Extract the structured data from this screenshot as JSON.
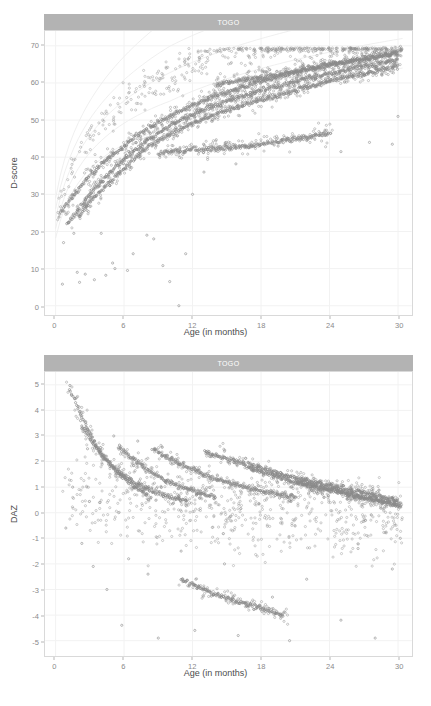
{
  "figure": {
    "width": 431,
    "height": 706,
    "background": "#ffffff",
    "point_color": "#8a8a8a",
    "strip_color": "#b3b3b3",
    "strip_text_color": "#ffffff",
    "grid_color": "#f2f2f2",
    "panel_border_color": "#d9d9d9",
    "axis_text_color": "#8a8a8a",
    "axis_title_color": "#4d4d4d"
  },
  "panels": [
    {
      "id": "dscore",
      "strip_label": "TOGO",
      "x_axis_title": "Age (in months)",
      "y_axis_title": "D-score",
      "x_ticks": [
        "0",
        "6",
        "12",
        "18",
        "24",
        "30"
      ],
      "y_ticks": [
        "0",
        "10",
        "20",
        "30",
        "40",
        "50",
        "60",
        "70"
      ]
    },
    {
      "id": "daz",
      "strip_label": "TOGO",
      "x_axis_title": "Age (in months)",
      "y_axis_title": "DAZ",
      "x_ticks": [
        "0",
        "6",
        "12",
        "18",
        "24",
        "30"
      ],
      "y_ticks": [
        "-5",
        "-4",
        "-3",
        "-2",
        "-1",
        "0",
        "1",
        "2",
        "3",
        "4",
        "5"
      ]
    }
  ],
  "chart_data": [
    {
      "type": "scatter",
      "title": "TOGO",
      "xlabel": "Age (in months)",
      "ylabel": "D-score",
      "xlim": [
        -0.9,
        31.2
      ],
      "ylim": [
        -2.5,
        74
      ],
      "x_ticks": [
        0,
        6,
        12,
        18,
        24,
        30
      ],
      "y_ticks": [
        0,
        10,
        20,
        30,
        40,
        50,
        60,
        70
      ],
      "grid": true,
      "legend": "none",
      "point_color": "#8a8a8a",
      "point_size": 1.1,
      "description": "D-score plotted against age in months for Togo; dense longitudinal cohort threads rise steeply from about 24 D-score at birth, pass ~45-50 around 9 months and saturate near 66-69 by 30 months, with a wide scatter of lower outliers.",
      "cohort_threads": [
        {
          "name": "thread-a",
          "x": [
            0.3,
            1.0,
            2.0,
            3.0,
            4.0,
            5.0,
            6.0,
            7.0,
            8.0,
            9.0,
            10.0,
            12.0,
            14.0,
            16.0,
            18.0,
            21.0,
            24.0,
            27.0,
            30.0
          ],
          "y": [
            24.0,
            27.5,
            31.5,
            35.0,
            38.0,
            40.5,
            43.0,
            45.5,
            47.5,
            49.5,
            51.0,
            54.0,
            56.5,
            58.5,
            60.5,
            63.0,
            65.0,
            66.5,
            68.0
          ]
        },
        {
          "name": "thread-b",
          "x": [
            1.0,
            2.0,
            3.0,
            4.0,
            5.0,
            6.0,
            7.0,
            8.0,
            9.0,
            10.0,
            12.0,
            14.0,
            16.0,
            18.0,
            21.0,
            24.0,
            27.0,
            30.0
          ],
          "y": [
            22.0,
            26.0,
            30.0,
            33.5,
            36.5,
            39.5,
            42.0,
            44.5,
            46.5,
            48.5,
            51.5,
            54.0,
            56.0,
            58.0,
            60.5,
            62.5,
            64.5,
            66.0
          ]
        },
        {
          "name": "thread-c",
          "x": [
            2.0,
            3.0,
            4.0,
            5.0,
            6.0,
            7.0,
            8.5,
            10.0,
            12.0,
            14.0,
            16.0,
            18.0,
            21.0,
            24.0,
            27.0,
            30.0
          ],
          "y": [
            24.0,
            28.0,
            31.0,
            34.0,
            37.0,
            40.0,
            43.5,
            46.0,
            49.0,
            51.5,
            53.5,
            55.5,
            58.0,
            60.5,
            62.5,
            64.5
          ]
        },
        {
          "name": "thread-d-plateau",
          "x": [
            9.0,
            10.0,
            11.0,
            12.0,
            13.0,
            14.0,
            15.0,
            16.0,
            17.0,
            18.0,
            20.0,
            22.0,
            24.0
          ],
          "y": [
            41.0,
            41.5,
            41.5,
            42.0,
            42.0,
            42.5,
            42.5,
            43.0,
            43.0,
            43.5,
            44.5,
            45.5,
            46.5
          ]
        },
        {
          "name": "thread-e-high",
          "x": [
            14.0,
            15.0,
            16.0,
            17.0,
            18.0,
            19.0,
            20.0,
            22.0,
            24.0,
            26.0,
            28.0,
            30.0
          ],
          "y": [
            59.5,
            60.0,
            60.5,
            61.0,
            61.5,
            62.0,
            62.5,
            63.5,
            65.0,
            66.0,
            67.0,
            68.0
          ]
        }
      ],
      "outlier_points": [
        {
          "x": 0.6,
          "y": 5.8
        },
        {
          "x": 0.7,
          "y": 17.0
        },
        {
          "x": 1.6,
          "y": 19.5
        },
        {
          "x": 1.9,
          "y": 9.0
        },
        {
          "x": 2.1,
          "y": 6.3
        },
        {
          "x": 2.6,
          "y": 8.5
        },
        {
          "x": 3.1,
          "y": 36.5
        },
        {
          "x": 3.4,
          "y": 7.0
        },
        {
          "x": 4.0,
          "y": 19.5
        },
        {
          "x": 4.4,
          "y": 8.2
        },
        {
          "x": 5.0,
          "y": 11.5
        },
        {
          "x": 5.2,
          "y": 10.0
        },
        {
          "x": 6.3,
          "y": 9.5
        },
        {
          "x": 6.8,
          "y": 14.0
        },
        {
          "x": 8.0,
          "y": 19.0
        },
        {
          "x": 8.6,
          "y": 18.0
        },
        {
          "x": 9.4,
          "y": 10.8
        },
        {
          "x": 10.0,
          "y": 6.5
        },
        {
          "x": 10.8,
          "y": 0.0
        },
        {
          "x": 11.4,
          "y": 14.0
        },
        {
          "x": 12.0,
          "y": 30.0
        },
        {
          "x": 13.0,
          "y": 36.0
        },
        {
          "x": 15.8,
          "y": 38.2
        },
        {
          "x": 19.5,
          "y": 43.0
        },
        {
          "x": 22.0,
          "y": 44.5
        },
        {
          "x": 25.0,
          "y": 41.5
        },
        {
          "x": 27.5,
          "y": 44.0
        },
        {
          "x": 29.5,
          "y": 43.5
        },
        {
          "x": 30.0,
          "y": 51.0
        }
      ]
    },
    {
      "type": "scatter",
      "title": "TOGO",
      "xlabel": "Age (in months)",
      "ylabel": "DAZ",
      "xlim": [
        -0.9,
        31.2
      ],
      "ylim": [
        -5.6,
        5.5
      ],
      "x_ticks": [
        0,
        6,
        12,
        18,
        24,
        30
      ],
      "y_ticks": [
        -5,
        -4,
        -3,
        -2,
        -1,
        0,
        1,
        2,
        3,
        4,
        5
      ],
      "grid": true,
      "legend": "none",
      "point_color": "#8a8a8a",
      "point_size": 1.1,
      "description": "D-score age-adjusted Z-score (DAZ) against age in months for Togo; multiple decaying arcs start high (DAZ 3 to 5) at young ages and decline toward 0 by 30 months, with a broad cloud of scattered points between -5 and +2.",
      "decay_arcs": [
        {
          "name": "arc-1",
          "x": [
            1.2,
            1.8,
            2.4,
            3.0,
            3.6,
            4.4,
            5.2,
            6.0,
            7.0,
            8.0
          ],
          "y": [
            4.9,
            4.3,
            3.7,
            3.1,
            2.6,
            2.1,
            1.7,
            1.35,
            1.0,
            0.75
          ]
        },
        {
          "name": "arc-2",
          "x": [
            2.2,
            3.0,
            4.0,
            5.0,
            6.0,
            7.0,
            8.5,
            10.0,
            11.5
          ],
          "y": [
            3.5,
            2.9,
            2.3,
            1.8,
            1.45,
            1.15,
            0.85,
            0.6,
            0.45
          ]
        },
        {
          "name": "arc-3",
          "x": [
            5.5,
            6.5,
            7.5,
            8.5,
            9.5,
            11.0,
            12.5,
            14.0
          ],
          "y": [
            2.6,
            2.2,
            1.85,
            1.55,
            1.3,
            1.0,
            0.8,
            0.6
          ]
        },
        {
          "name": "arc-4",
          "x": [
            8.5,
            10.0,
            11.5,
            13.0,
            15.0,
            17.0,
            19.0,
            21.0
          ],
          "y": [
            2.5,
            2.1,
            1.8,
            1.5,
            1.2,
            0.95,
            0.75,
            0.6
          ]
        },
        {
          "name": "arc-5",
          "x": [
            13.0,
            15.0,
            17.0,
            19.0,
            21.0,
            23.0,
            25.5,
            28.0,
            30.0
          ],
          "y": [
            2.4,
            2.1,
            1.85,
            1.6,
            1.35,
            1.15,
            0.9,
            0.7,
            0.5
          ]
        },
        {
          "name": "arc-6",
          "x": [
            17.0,
            19.0,
            21.0,
            23.0,
            25.0,
            27.0,
            29.0,
            30.2
          ],
          "y": [
            1.7,
            1.45,
            1.2,
            1.0,
            0.8,
            0.6,
            0.4,
            0.3
          ]
        },
        {
          "name": "arc-7",
          "x": [
            21.0,
            23.0,
            25.0,
            27.0,
            29.0,
            30.3
          ],
          "y": [
            1.2,
            1.0,
            0.8,
            0.6,
            0.4,
            0.25
          ]
        },
        {
          "name": "arc-low",
          "x": [
            11.0,
            12.5,
            14.0,
            15.5,
            17.0,
            18.5,
            20.0
          ],
          "y": [
            -2.6,
            -2.9,
            -3.2,
            -3.4,
            -3.6,
            -3.8,
            -4.0
          ]
        }
      ],
      "outlier_points": [
        {
          "x": 0.9,
          "y": -0.6
        },
        {
          "x": 1.5,
          "y": 1.0
        },
        {
          "x": 2.3,
          "y": -1.2
        },
        {
          "x": 2.8,
          "y": 2.5
        },
        {
          "x": 3.3,
          "y": -2.1
        },
        {
          "x": 3.9,
          "y": 0.4
        },
        {
          "x": 4.5,
          "y": -3.0
        },
        {
          "x": 5.1,
          "y": 3.0
        },
        {
          "x": 5.8,
          "y": -4.4
        },
        {
          "x": 6.4,
          "y": -1.8
        },
        {
          "x": 7.2,
          "y": 2.8
        },
        {
          "x": 8.1,
          "y": -2.4
        },
        {
          "x": 9.0,
          "y": -4.9
        },
        {
          "x": 10.2,
          "y": 1.9
        },
        {
          "x": 11.0,
          "y": -1.5
        },
        {
          "x": 12.2,
          "y": -4.6
        },
        {
          "x": 13.5,
          "y": 2.2
        },
        {
          "x": 14.8,
          "y": -2.0
        },
        {
          "x": 16.0,
          "y": -4.8
        },
        {
          "x": 17.5,
          "y": 0.9
        },
        {
          "x": 19.0,
          "y": -3.3
        },
        {
          "x": 20.5,
          "y": -5.0
        },
        {
          "x": 22.0,
          "y": -2.6
        },
        {
          "x": 23.5,
          "y": 0.6
        },
        {
          "x": 25.0,
          "y": -4.2
        },
        {
          "x": 26.5,
          "y": -1.4
        },
        {
          "x": 28.0,
          "y": -4.9
        },
        {
          "x": 29.5,
          "y": -2.2
        },
        {
          "x": 30.2,
          "y": -1.0
        }
      ]
    }
  ]
}
